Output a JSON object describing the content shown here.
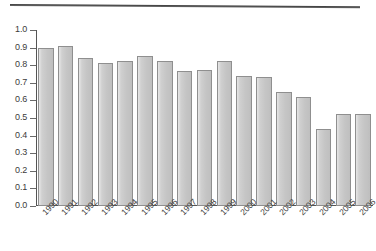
{
  "chart_data": {
    "type": "bar",
    "title": "",
    "subtitle": "",
    "xlabel": "",
    "ylabel": "",
    "ylim": [
      0.0,
      1.0
    ],
    "grid": false,
    "legend": null,
    "orientation": "vertical",
    "bar_fill_color": "#c9c9c9",
    "bar_border_color": "#8f8f8f",
    "categories": [
      "1990",
      "1991",
      "1992",
      "1993",
      "1994",
      "1995",
      "1996",
      "1997",
      "1998",
      "1999",
      "2000",
      "2001",
      "2002",
      "2003",
      "2004",
      "2005",
      "2006"
    ],
    "values": [
      0.9,
      0.91,
      0.84,
      0.81,
      0.825,
      0.855,
      0.825,
      0.765,
      0.77,
      0.825,
      0.74,
      0.735,
      0.65,
      0.62,
      0.435,
      0.525,
      0.52
    ],
    "ytick_labels": [
      "1.0",
      "0.9",
      "0.8",
      "0.7",
      "0.6",
      "0.5",
      "0.4",
      "0.3",
      "0.2",
      "0.1",
      "0.0"
    ],
    "ytick_values": [
      1.0,
      0.9,
      0.8,
      0.7,
      0.6,
      0.5,
      0.4,
      0.3,
      0.2,
      0.1,
      0.0
    ],
    "xtick_label_rotation_deg": -45
  }
}
